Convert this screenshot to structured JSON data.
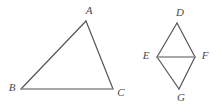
{
  "figure": {
    "background_color": "#ffffff",
    "stroke_color_slant": "#555555",
    "stroke_color_horizontal": "#8a8a8a",
    "label_color": "#4a4a4a",
    "stroke_width": 1.2,
    "shapes": [
      {
        "id": "triangle-abc",
        "name": "triangle-abc",
        "kind": "triangle",
        "vertices": [
          {
            "label": "A",
            "x": 86,
            "y": 21,
            "label_x": 89,
            "label_y": 11
          },
          {
            "label": "B",
            "x": 21,
            "y": 89,
            "label_x": 12,
            "label_y": 88
          },
          {
            "label": "C",
            "x": 113,
            "y": 89,
            "label_x": 121,
            "label_y": 93
          }
        ],
        "edges": [
          {
            "name": "edge-ab",
            "from": "A",
            "to": "B",
            "style": "slant"
          },
          {
            "name": "edge-ac",
            "from": "A",
            "to": "C",
            "style": "slant"
          },
          {
            "name": "edge-bc",
            "from": "B",
            "to": "C",
            "style": "horizontal"
          }
        ]
      },
      {
        "id": "kite-degf",
        "name": "kite-degf",
        "kind": "kite",
        "vertices": [
          {
            "label": "D",
            "x": 177,
            "y": 23,
            "label_x": 180,
            "label_y": 13
          },
          {
            "label": "E",
            "x": 157,
            "y": 57,
            "label_x": 146,
            "label_y": 56
          },
          {
            "label": "F",
            "x": 195,
            "y": 57,
            "label_x": 205,
            "label_y": 56
          },
          {
            "label": "G",
            "x": 179,
            "y": 89,
            "label_x": 181,
            "label_y": 98
          }
        ],
        "edges": [
          {
            "name": "edge-de",
            "from": "D",
            "to": "E",
            "style": "slant"
          },
          {
            "name": "edge-df",
            "from": "D",
            "to": "F",
            "style": "slant"
          },
          {
            "name": "edge-eg",
            "from": "E",
            "to": "G",
            "style": "slant"
          },
          {
            "name": "edge-fg",
            "from": "F",
            "to": "G",
            "style": "slant"
          },
          {
            "name": "edge-ef",
            "from": "E",
            "to": "F",
            "style": "horizontal"
          }
        ]
      }
    ]
  }
}
